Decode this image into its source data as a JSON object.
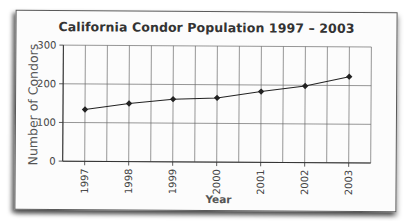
{
  "chart_data": {
    "type": "line",
    "title": "California Condor Population 1997 – 2003",
    "xlabel": "Year",
    "ylabel": "Number of Condors",
    "categories": [
      "1997",
      "1998",
      "1999",
      "2000",
      "2001",
      "2002",
      "2003"
    ],
    "series": [
      {
        "name": "Condor population",
        "values": [
          134,
          150,
          162,
          166,
          183,
          198,
          223
        ],
        "marker": "diamond",
        "color": "#222222"
      }
    ],
    "ylim": [
      0,
      300
    ],
    "yticks": [
      "0",
      "100",
      "200",
      "300"
    ],
    "grid": true,
    "legend": null
  },
  "colors": {
    "title": "#333333",
    "axis_label": "#555555",
    "grid": "#6a6a6a",
    "line": "#222222",
    "card_border": "#5a5a5a"
  }
}
